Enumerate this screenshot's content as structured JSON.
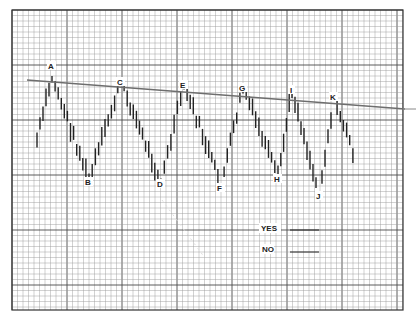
{
  "chart_data": {
    "type": "bar",
    "subtype": "ohlc-price-bars",
    "title": "",
    "xlabel": "",
    "ylabel": "",
    "grid": true,
    "legend": null,
    "trendline": {
      "start": {
        "x": 27,
        "y": 80
      },
      "end": {
        "x": 405,
        "y": 109
      },
      "direction": "descending"
    },
    "swing_points": [
      {
        "label": "A",
        "type": "high",
        "x": 52,
        "y": 76
      },
      {
        "label": "B",
        "type": "low",
        "x": 89,
        "y": 180
      },
      {
        "label": "C",
        "type": "high",
        "x": 121,
        "y": 81
      },
      {
        "label": "D",
        "type": "low",
        "x": 161,
        "y": 183
      },
      {
        "label": "E",
        "type": "high",
        "x": 184,
        "y": 84
      },
      {
        "label": "F",
        "type": "low",
        "x": 221,
        "y": 186
      },
      {
        "label": "G",
        "type": "high",
        "x": 243,
        "y": 87
      },
      {
        "label": "H",
        "type": "low",
        "x": 278,
        "y": 178
      },
      {
        "label": "I",
        "type": "high",
        "x": 292,
        "y": 89
      },
      {
        "label": "J",
        "type": "low",
        "x": 319,
        "y": 195
      },
      {
        "label": "K",
        "type": "high",
        "x": 334,
        "y": 97
      }
    ],
    "answer_fields": [
      {
        "label": "YES",
        "value": ""
      },
      {
        "label": "NO",
        "value": ""
      }
    ]
  },
  "labels": {
    "A": "A",
    "B": "B",
    "C": "C",
    "D": "D",
    "E": "E",
    "F": "F",
    "G": "G",
    "H": "H",
    "I": "I",
    "J": "J",
    "K": "K"
  },
  "answers": {
    "yes_label": "YES",
    "no_label": "NO"
  },
  "colors": {
    "grid_minor": "#9a9a9a",
    "grid_major": "#4a4a4a",
    "bars": "#222222",
    "trendline": "#6e6e6e",
    "frame": "#333333"
  }
}
